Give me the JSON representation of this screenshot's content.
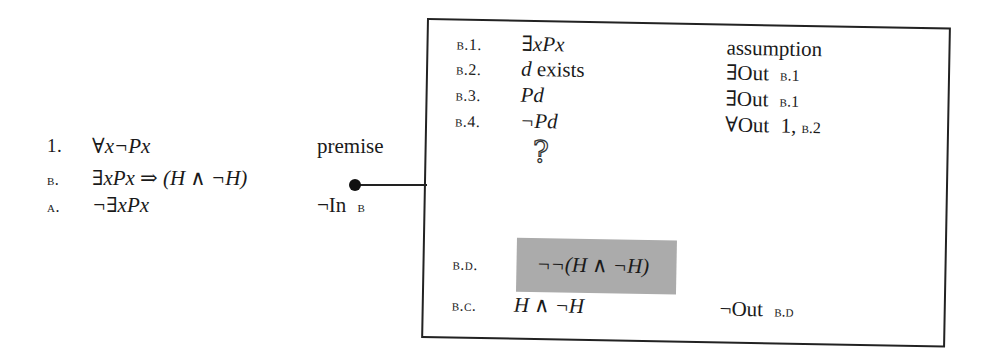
{
  "main_proof": {
    "lines": [
      {
        "label": "1.",
        "formula": "∀x¬Px",
        "justification": "premise",
        "justification_ref": ""
      },
      {
        "label": "b.",
        "formula": "∃xPx ⇒ (H ∧ ¬H)",
        "justification": "",
        "justification_ref": ""
      },
      {
        "label": "a.",
        "formula": "¬∃xPx",
        "justification": "¬In",
        "justification_ref": "b"
      }
    ],
    "connector": {
      "from_line": "b.",
      "to": "subproof-box",
      "icon": "bullet-dot"
    }
  },
  "subproof": {
    "lines": [
      {
        "label": "b.1.",
        "formula": "∃xPx",
        "justification": "assumption",
        "justification_ref": ""
      },
      {
        "label": "b.2.",
        "formula_italic": "d",
        "formula_rest": " exists",
        "justification": "∃Out",
        "justification_ref": "b.1"
      },
      {
        "label": "b.3.",
        "formula": "Pd",
        "justification": "∃Out",
        "justification_ref": "b.1"
      },
      {
        "label": "b.4.",
        "formula": "¬Pd",
        "justification": "∀Out",
        "justification_ref_num": "1,",
        "justification_ref": "b.2"
      }
    ],
    "gap_icon": "?",
    "goal": {
      "label": "b.d.",
      "formula": "¬¬(H ∧ ¬H)",
      "highlight_color": "#ababab"
    },
    "conclusion": {
      "label": "b.c.",
      "formula": "H ∧ ¬H",
      "justification": "¬Out",
      "justification_ref": "b.d"
    }
  }
}
